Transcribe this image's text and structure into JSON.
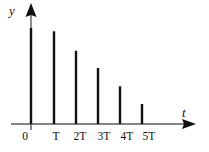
{
  "chart_data": {
    "type": "bar",
    "title": "",
    "subtitle": "",
    "xlabel": "t",
    "ylabel": "y",
    "categories": [
      "0",
      "T",
      "2T",
      "3T",
      "4T",
      "5T"
    ],
    "x": [
      0,
      1,
      2,
      3,
      4,
      5
    ],
    "values": [
      96,
      93,
      73,
      56,
      38,
      20
    ],
    "xlim": [
      -0.2,
      7.0
    ],
    "ylim": [
      0,
      104
    ],
    "grid": false,
    "legend": null,
    "annotations": [],
    "series_color": "#111111",
    "axis_color": "#555555",
    "bar_style": "impulse-stem",
    "bar_width_px": 2.4
  },
  "figure": {
    "background": "#ffffff",
    "width": 209,
    "height": 152,
    "origin_x": 31,
    "baseline_y": 124,
    "y_axis_top": 4,
    "x_axis_right": 196,
    "spacing_px": 22.4
  },
  "axes": {
    "y_axis_name": "y",
    "x_axis_name": "t",
    "y_label_text": "y",
    "x_label_text": "t"
  },
  "ticks": {
    "labels": [
      "0",
      "T",
      "2T",
      "3T",
      "4T",
      "5T"
    ],
    "positions_px": [
      25,
      56,
      80,
      104,
      127,
      149
    ]
  },
  "impulses": [
    {
      "label": "0",
      "x_px": 31,
      "top_y_px": 28,
      "height_px": 96
    },
    {
      "label": "T",
      "x_px": 54,
      "top_y_px": 31.3,
      "height_px": 93
    },
    {
      "label": "2T",
      "x_px": 76,
      "top_y_px": 50.7,
      "height_px": 73
    },
    {
      "label": "3T",
      "x_px": 98,
      "top_y_px": 68,
      "height_px": 56
    },
    {
      "label": "4T",
      "x_px": 120,
      "top_y_px": 86.3,
      "height_px": 38
    },
    {
      "label": "5T",
      "x_px": 142,
      "top_y_px": 104,
      "height_px": 20
    }
  ]
}
